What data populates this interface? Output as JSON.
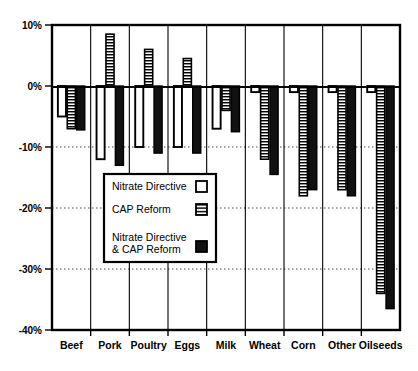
{
  "chart_data": {
    "type": "bar",
    "title": "",
    "subtitle": "",
    "xlabel": "",
    "ylabel": "",
    "categories": [
      "Beef",
      "Pork",
      "Poultry",
      "Eggs",
      "Milk",
      "Wheat",
      "Corn",
      "Other",
      "Oilseeds"
    ],
    "series": [
      {
        "name": "Nitrate Directive",
        "pattern": "open",
        "values": [
          -5.0,
          -12.0,
          -10.0,
          -10.0,
          -7.0,
          -1.0,
          -1.0,
          -1.0,
          -1.0
        ]
      },
      {
        "name": "CAP Reform",
        "pattern": "hatched",
        "values": [
          -7.0,
          8.5,
          6.0,
          4.5,
          -4.0,
          -12.0,
          -18.0,
          -17.0,
          -34.0
        ]
      },
      {
        "name": "Nitrate Directive & CAP Reform",
        "pattern": "solid",
        "values": [
          -7.2,
          -13.0,
          -11.0,
          -11.0,
          -7.5,
          -14.5,
          -17.0,
          -18.0,
          -36.5
        ]
      }
    ],
    "ylim": [
      -40,
      10
    ],
    "yticks": [
      10,
      0,
      -10,
      -20,
      -30,
      -40
    ],
    "ytick_labels": [
      "10%",
      "0%",
      "-10%",
      "-20%",
      "-30%",
      "-40%"
    ],
    "grid": true,
    "grid_axis": "y",
    "legend_position": "center-left-inside",
    "zero_line": true
  },
  "legend": {
    "entries": [
      {
        "label": "Nitrate Directive",
        "label_line2": "",
        "swatch": "open-square-icon"
      },
      {
        "label": "CAP Reform",
        "label_line2": "",
        "swatch": "hatched-square-icon"
      },
      {
        "label": "Nitrate Directive",
        "label_line2": "& CAP Reform",
        "swatch": "solid-square-icon"
      }
    ]
  }
}
